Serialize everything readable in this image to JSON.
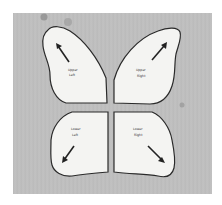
{
  "image": {
    "description": "Photograph of four paper butterfly wing cutouts on a gray textured surface",
    "background_color": "#bdbdbd",
    "wing_color": "#f4f4f2",
    "outline_color": "#2a2a2a"
  },
  "wings": [
    {
      "id": "upper-left",
      "label_line1": "Upper",
      "label_line2": "Left",
      "arrow_direction": "up-left"
    },
    {
      "id": "upper-right",
      "label_line1": "Upper",
      "label_line2": "Right",
      "arrow_direction": "up-right"
    },
    {
      "id": "lower-left",
      "label_line1": "Lower",
      "label_line2": "Left",
      "arrow_direction": "down-left"
    },
    {
      "id": "lower-right",
      "label_line1": "Lower",
      "label_line2": "Right",
      "arrow_direction": "down-right"
    }
  ]
}
